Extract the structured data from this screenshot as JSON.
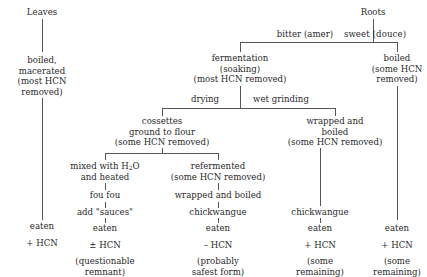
{
  "diagram": {
    "leaves": {
      "title": "Leaves",
      "step1": [
        "boiled,",
        "macerated",
        "(most HCN",
        "removed)"
      ],
      "eaten": "eaten",
      "hcn": "+ HCN"
    },
    "roots": {
      "title": "Roots",
      "bitter_label": "bitter (amer)",
      "sweet_label": "sweet (douce)",
      "fermentation": [
        "fermentation",
        "(soaking)",
        "(most HCN removed)"
      ],
      "sweet_boiled": [
        "boiled",
        "(some HCN",
        "removed)"
      ],
      "drying_label": "drying",
      "wet_grinding_label": "wet grinding",
      "cossettes": [
        "cossettes",
        "ground to flour",
        "(some HCN removed)"
      ],
      "wrapped_boiled": [
        "wrapped and",
        "boiled",
        "(some HCN removed)"
      ],
      "mixed": {
        "line1_prefix": "mixed with H",
        "line1_sub": "2",
        "line1_suffix": "O",
        "line2": "and heated"
      },
      "fou_fou": "fou fou",
      "add_sauces": "add \"sauces\"",
      "refermented": [
        "refermented",
        "(some HCN removed)"
      ],
      "refermented_wrapped": "wrapped and boiled",
      "chickwangue_dry": "chickwangue",
      "chickwangue_wet": "chickwangue"
    },
    "outcomes": {
      "foufou": {
        "eaten": "eaten",
        "hcn": "± HCN",
        "note": [
          "(questionable",
          "remnant)"
        ]
      },
      "chickwangue_dry": {
        "eaten": "eaten",
        "hcn": "– HCN",
        "note": [
          "(probably",
          "safest form)"
        ]
      },
      "chickwangue_wet": {
        "eaten": "eaten",
        "hcn": "+ HCN",
        "note": [
          "(some",
          "remaining)"
        ]
      },
      "sweet": {
        "eaten": "eaten",
        "hcn": "+ HCN",
        "note": [
          "(some",
          "remaining)"
        ]
      }
    }
  }
}
